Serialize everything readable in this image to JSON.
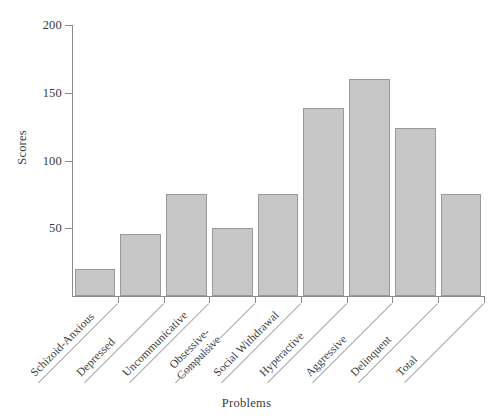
{
  "chart_data": {
    "type": "bar",
    "title": "",
    "xlabel": "Problems",
    "ylabel": "Scores",
    "categories": [
      "Schizoid-Anxious",
      "Depressed",
      "Uncommunicative",
      "Obsessive-Compulsive",
      "Social Withdrawal",
      "Hyperactive",
      "Aggressive",
      "Delinquent",
      "Total"
    ],
    "values": [
      20,
      46,
      75,
      50,
      75,
      139,
      160,
      124,
      75
    ],
    "ylim": [
      0,
      200
    ],
    "yticks": [
      50,
      100,
      150,
      200
    ],
    "ytick_labels": [
      "50",
      "100",
      "150",
      "200"
    ],
    "grid": false,
    "legend": false,
    "bar_fill_color": "#c6c6c6",
    "bar_edge_color": "#9a9a9a",
    "axis_color": "#8a8a8a"
  },
  "axes": {
    "y_title": "Scores",
    "x_title": "Problems"
  },
  "categories_display": [
    {
      "line1": "Schizoid-Anxious",
      "line2": ""
    },
    {
      "line1": "Depressed",
      "line2": ""
    },
    {
      "line1": "Uncommunicative",
      "line2": ""
    },
    {
      "line1": "Obsessive-",
      "line2": "Compulsive"
    },
    {
      "line1": "Social Withdrawal",
      "line2": ""
    },
    {
      "line1": "Hyperactive",
      "line2": ""
    },
    {
      "line1": "Aggressive",
      "line2": ""
    },
    {
      "line1": "Delinquent",
      "line2": ""
    },
    {
      "line1": "Total",
      "line2": ""
    }
  ]
}
